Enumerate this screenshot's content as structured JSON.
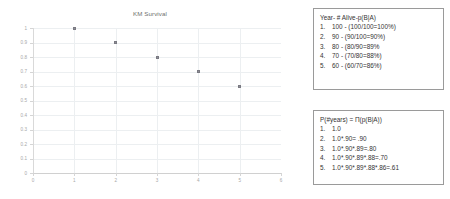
{
  "chart_data": {
    "type": "scatter",
    "title": "KM Survival",
    "xlabel": "",
    "ylabel": "",
    "x": [
      1,
      2,
      3,
      4,
      5
    ],
    "values": [
      1,
      0.9,
      0.8,
      0.7,
      0.6
    ],
    "categories": [
      "1",
      "2",
      "3",
      "4",
      "5"
    ],
    "xlim": [
      0,
      6
    ],
    "ylim": [
      0,
      1
    ],
    "xticks": [
      "0",
      "1",
      "2",
      "3",
      "4",
      "5",
      "6"
    ],
    "yticks": [
      "1",
      "0.9",
      "0.8",
      "0.7",
      "0.6",
      "0.5",
      "0.4",
      "0.3",
      "0.2",
      "0.1",
      "0"
    ],
    "grid": true,
    "legend": "none",
    "marker_color": "#8f8f97"
  },
  "boxes": {
    "conditional": {
      "header": "Year- # Alive-p(B|A)",
      "items": [
        {
          "num": "1.",
          "text": "100 - (100/100=100%)"
        },
        {
          "num": "2.",
          "text": "90 - (90/100=90%)"
        },
        {
          "num": "3.",
          "text": "80 - (80/90=89%"
        },
        {
          "num": "4.",
          "text": "70 -  (70/80=88%)"
        },
        {
          "num": "5.",
          "text": "60 -  (60/70=86%)"
        }
      ]
    },
    "product": {
      "header": "P(#years) = Π(p(B|A))",
      "items": [
        {
          "num": "1.",
          "text": "1.0"
        },
        {
          "num": "2.",
          "text": "1.0*.90= .90"
        },
        {
          "num": "3.",
          "text": "1.0*.90*.89=.80"
        },
        {
          "num": "4.",
          "text": "1.0*.90*.89*.88=.70"
        },
        {
          "num": "5.",
          "text": "1.0*.90*.89*.88*.86=.61"
        }
      ]
    }
  }
}
